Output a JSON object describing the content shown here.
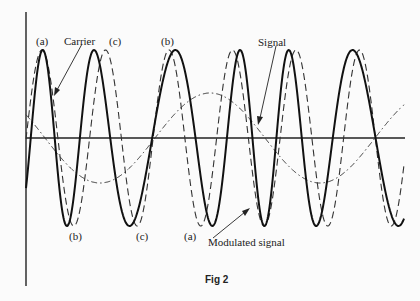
{
  "figure": {
    "caption": "Fig 2",
    "labels": {
      "carrier": "Carrier",
      "signal": "Signal",
      "modulated_signal": "Modulated signal",
      "point_a_top": "(a)",
      "point_c_top": "(c)",
      "point_b_top": "(b)",
      "point_b_bottom": "(b)",
      "point_c_bottom": "(c)",
      "point_a_bottom": "(a)"
    },
    "colors": {
      "ink": "#222222",
      "background": "#fbfbfb"
    }
  },
  "chart_data": {
    "type": "line",
    "title": "Fig 2",
    "series": [
      {
        "name": "Carrier",
        "style": "dashed",
        "peaks_x_px": [
          42,
          105,
          168,
          232,
          296,
          360
        ],
        "amplitude": "full"
      },
      {
        "name": "Signal",
        "style": "dash-dot",
        "shape": "sine, ~1.5 cycles, low amplitude"
      },
      {
        "name": "Modulated signal",
        "style": "solid",
        "peaks_x_px": [
          26,
          117,
          167,
          245,
          325,
          395
        ],
        "troughs_x_px": [
          75,
          143,
          190,
          270,
          350
        ]
      }
    ],
    "annotations": [
      "(a)",
      "(b)",
      "(c)",
      "Carrier",
      "Signal",
      "Modulated signal"
    ],
    "axes": {
      "x": "time",
      "y": "amplitude",
      "ticks": "none"
    }
  }
}
